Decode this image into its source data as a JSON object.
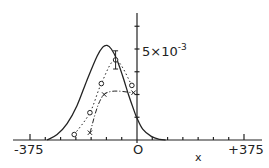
{
  "chart_data": {
    "type": "line",
    "title": "",
    "xlabel": "x",
    "ylabel": "",
    "xlim": [
      -375,
      375
    ],
    "ylim": [
      0,
      0.0064
    ],
    "x_tick_labels": [
      "-375",
      "0",
      "+375"
    ],
    "x_minor_tick_step": 53.57,
    "y_tick_step": 0.00125,
    "y_annotation": "5×10⁻³",
    "grid": false,
    "legend": null,
    "series": [
      {
        "name": "theory (solid)",
        "style": "solid",
        "x": [
          -315,
          -280,
          -245,
          -210,
          -175,
          -140,
          -120,
          -105,
          -90,
          -70,
          -50,
          -30,
          -10,
          0,
          20,
          50,
          80,
          100
        ],
        "values": [
          0.0,
          0.0003,
          0.0009,
          0.0019,
          0.0033,
          0.0046,
          0.0051,
          0.0052,
          0.005,
          0.0044,
          0.0035,
          0.0025,
          0.0016,
          0.0012,
          0.0006,
          0.0002,
          3e-05,
          0.0
        ]
      },
      {
        "name": "data (circles, dotted)",
        "style": "dotted",
        "marker": "circle",
        "x": [
          -220,
          -165,
          -125,
          -75,
          -18
        ],
        "values": [
          0.0003,
          0.0015,
          0.0031,
          0.0044,
          0.003
        ]
      },
      {
        "name": "data (crosses, dash-dot)",
        "style": "dash-dot",
        "marker": "cross",
        "x": [
          -165,
          -115,
          -12
        ],
        "values": [
          0.0004,
          0.0025,
          0.0026
        ]
      }
    ],
    "error_bars": [
      {
        "x": -75,
        "y": 0.0044,
        "low": 0.0039,
        "high": 0.0049
      }
    ]
  },
  "labels": {
    "x_min": "-375",
    "x_zero": "O",
    "x_max": "+375",
    "x_axis": "x",
    "y_mantissa": "5×10",
    "y_exponent": "-3"
  }
}
